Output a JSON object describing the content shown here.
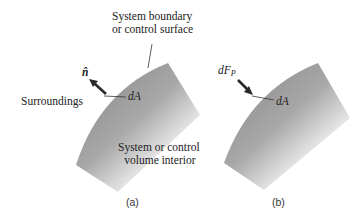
{
  "diagram": {
    "panel_a": {
      "boundary_label_line1": "System boundary",
      "boundary_label_line2": "or control surface",
      "normal_vector": "n̂",
      "area_element": "dA",
      "surroundings": "Surroundings",
      "interior_line1": "System or control",
      "interior_line2": "volume interior",
      "caption": "(a)"
    },
    "panel_b": {
      "force_symbol": "dF",
      "force_subscript": "P",
      "area_element": "dA",
      "caption": "(b)"
    },
    "colors": {
      "region_dark": "#8a8a8a",
      "region_light": "#ffffff",
      "arrow": "#2a2a2a",
      "text": "#222222"
    }
  }
}
